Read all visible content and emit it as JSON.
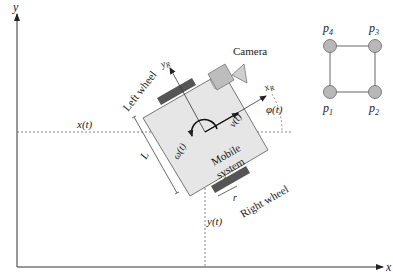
{
  "diagram": {
    "axes": {
      "x_label": "x",
      "y_label": "y"
    },
    "coordinates": {
      "x_of_t": "x(t)",
      "y_of_t": "y(t)"
    },
    "robot": {
      "body_label_line1": "Mobile",
      "body_label_line2": "system",
      "left_wheel": "Left wheel",
      "right_wheel": "Right wheel",
      "camera": "Camera",
      "length_label": "L",
      "wheel_radius_label": "r",
      "robot_x_axis": "x",
      "robot_x_sub": "R",
      "robot_y_axis": "y",
      "robot_y_sub": "R",
      "velocity": "v(t)",
      "angular_velocity": "ω(t)",
      "heading": "φ(t)"
    },
    "formation": {
      "points": [
        {
          "name": "p",
          "sub": "4"
        },
        {
          "name": "p",
          "sub": "3"
        },
        {
          "name": "p",
          "sub": "1"
        },
        {
          "name": "p",
          "sub": "2"
        }
      ]
    },
    "colors": {
      "body_fill": "#e6e6e6",
      "wheel_fill": "#555555",
      "node_fill": "#b8b8b8",
      "line": "#333333"
    }
  }
}
